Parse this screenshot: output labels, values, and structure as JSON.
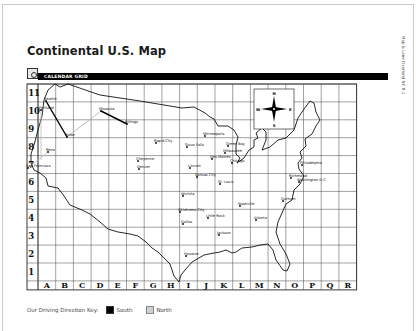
{
  "header": {
    "title": "Continental U.S. Map",
    "side_text": "Map & Lane Overland NC 8-1"
  },
  "section": {
    "label": "CALENDAR GRID",
    "icon": "calendar-grid-icon"
  },
  "grid": {
    "rows": [
      "11",
      "10",
      "9",
      "8",
      "7",
      "6",
      "5",
      "4",
      "3",
      "2",
      "1"
    ],
    "columns": [
      "A",
      "B",
      "C",
      "D",
      "E",
      "F",
      "G",
      "H",
      "I",
      "J",
      "K",
      "L",
      "M",
      "N",
      "O",
      "P",
      "Q",
      "R"
    ]
  },
  "compass": {
    "n": "N",
    "s": "S",
    "e": "E",
    "w": "W"
  },
  "cities": [
    {
      "name": "Seattle",
      "x": 46,
      "y": 101
    },
    {
      "name": "Portland",
      "x": 41,
      "y": 110
    },
    {
      "name": "Boise",
      "x": 67,
      "y": 137
    },
    {
      "name": "Missoula",
      "x": 101,
      "y": 111
    },
    {
      "name": "Billings",
      "x": 127,
      "y": 124
    },
    {
      "name": "Reno",
      "x": 48,
      "y": 152
    },
    {
      "name": "San Francisco",
      "x": 28,
      "y": 168
    },
    {
      "name": "Cheyenne",
      "x": 138,
      "y": 161
    },
    {
      "name": "Denver",
      "x": 139,
      "y": 169
    },
    {
      "name": "Rapid City",
      "x": 156,
      "y": 143
    },
    {
      "name": "Minneapolis",
      "x": 205,
      "y": 136
    },
    {
      "name": "Sioux Falls",
      "x": 187,
      "y": 147
    },
    {
      "name": "Green Bay",
      "x": 228,
      "y": 146
    },
    {
      "name": "Milwaukee",
      "x": 225,
      "y": 153
    },
    {
      "name": "Des Moines",
      "x": 212,
      "y": 159
    },
    {
      "name": "Chicago",
      "x": 232,
      "y": 163
    },
    {
      "name": "Lincoln",
      "x": 190,
      "y": 168
    },
    {
      "name": "Kansas City",
      "x": 197,
      "y": 177
    },
    {
      "name": "St. Louis",
      "x": 220,
      "y": 184
    },
    {
      "name": "Wichita",
      "x": 183,
      "y": 196
    },
    {
      "name": "Oklahoma City",
      "x": 180,
      "y": 212
    },
    {
      "name": "Dallas",
      "x": 183,
      "y": 224
    },
    {
      "name": "Little Rock",
      "x": 208,
      "y": 218
    },
    {
      "name": "Nashville",
      "x": 240,
      "y": 206
    },
    {
      "name": "Atlanta",
      "x": 256,
      "y": 220
    },
    {
      "name": "Jackson",
      "x": 219,
      "y": 235
    },
    {
      "name": "Houston",
      "x": 186,
      "y": 256
    },
    {
      "name": "Philadelphia",
      "x": 302,
      "y": 165
    },
    {
      "name": "Richmond",
      "x": 291,
      "y": 178
    },
    {
      "name": "Washington D.C.",
      "x": 299,
      "y": 182
    },
    {
      "name": "Durham",
      "x": 283,
      "y": 201
    }
  ],
  "legend": {
    "label": "Our Driving Direction Key:",
    "south": "South",
    "north": "North",
    "colors": {
      "south": "#000000",
      "north": "#d0d0d0"
    }
  }
}
